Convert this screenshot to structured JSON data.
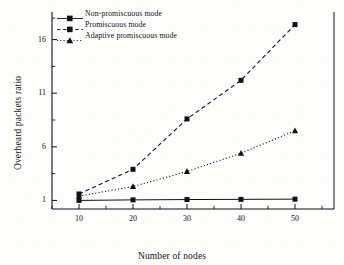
{
  "chart_data": {
    "type": "line",
    "title": "",
    "xlabel": "Number of nodes",
    "ylabel": "Overheard packets ratio",
    "x": [
      10,
      20,
      30,
      40,
      50
    ],
    "xticklabels": [
      "10",
      "20",
      "30",
      "40",
      "50"
    ],
    "yticklabels": [
      "1",
      "6",
      "11",
      "16"
    ],
    "yticks": [
      1,
      6,
      11,
      16
    ],
    "xlim": [
      5,
      55
    ],
    "ylim": [
      0.2,
      18.2
    ],
    "grid": false,
    "legend_position": "upper left",
    "series": [
      {
        "name": "Non-promiscuous mode",
        "values": [
          1.0,
          1.05,
          1.08,
          1.1,
          1.12
        ],
        "line_style": "solid",
        "marker": "square",
        "color": "#111111"
      },
      {
        "name": "Promiscuous mode",
        "values": [
          1.6,
          3.9,
          8.6,
          12.2,
          17.4
        ],
        "line_style": "dashed",
        "marker": "square",
        "color": "#111111"
      },
      {
        "name": "Adaptive promiscuous mode",
        "values": [
          1.4,
          2.3,
          3.7,
          5.4,
          7.5
        ],
        "line_style": "dotted",
        "marker": "triangle",
        "color": "#111111"
      }
    ]
  },
  "legend": {
    "items": [
      {
        "label": "Non-promiscuous mode"
      },
      {
        "label": "Promiscuous mode"
      },
      {
        "label": "Adaptive promiscuous mode"
      }
    ]
  },
  "axes": {
    "x_title": "Number of nodes",
    "y_title": "Overheard packets ratio"
  },
  "colors": {
    "ink": "#111111",
    "paper": "#fdfdfc"
  }
}
